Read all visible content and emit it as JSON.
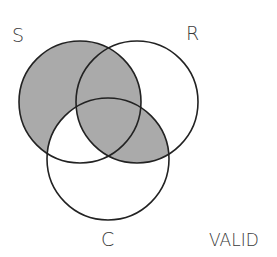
{
  "diagram": {
    "type": "venn-3",
    "sets": [
      {
        "id": "S",
        "label": "S",
        "cx": 80,
        "cy": 102,
        "r": 61
      },
      {
        "id": "R",
        "label": "R",
        "cx": 137,
        "cy": 102,
        "r": 61
      },
      {
        "id": "C",
        "label": "C",
        "cx": 108,
        "cy": 159,
        "r": 61
      }
    ],
    "shaded_regions": [
      "S only",
      "S∩R not C",
      "S∩R∩C",
      "R∩C not S"
    ],
    "unshaded_regions": [
      "S∩C not R",
      "R only",
      "C only"
    ],
    "verdict": "VALID"
  },
  "labels": {
    "s": "S",
    "r": "R",
    "c": "C",
    "verdict": "VALID"
  },
  "colors": {
    "shade": "#aaaaaa",
    "stroke": "#222222",
    "background": "#ffffff"
  }
}
